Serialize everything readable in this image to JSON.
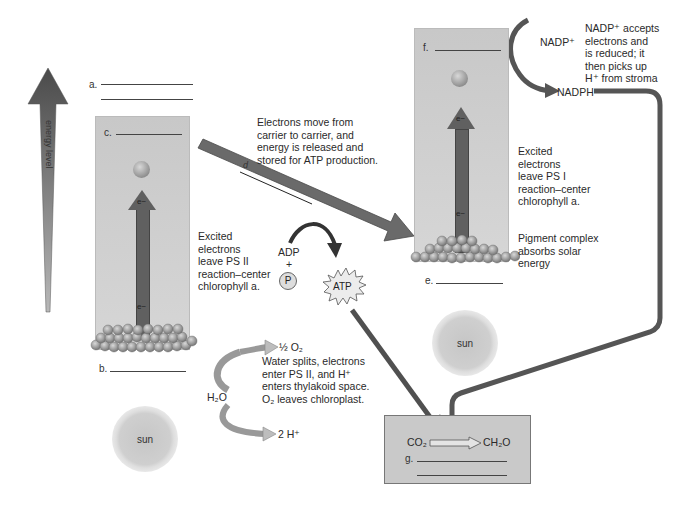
{
  "energy_axis": {
    "label": "energy level"
  },
  "labels": {
    "a": "a.",
    "b": "b.",
    "c": "c.",
    "d": "d",
    "e": "e.",
    "f": "f.",
    "g": "g."
  },
  "ps2": {
    "electron_top": "e−",
    "electron_bottom": "e−",
    "caption": [
      "Excited",
      "electrons",
      "leave PS II",
      "reaction–center",
      "chlorophyll a."
    ]
  },
  "ps1": {
    "electron_top": "e−",
    "electron_bottom": "e−",
    "caption": [
      "Excited",
      "electrons",
      "leave PS I",
      "reaction–center",
      "chlorophyll a."
    ],
    "pigment_caption": [
      "Pigment complex",
      "absorbs solar",
      "energy"
    ]
  },
  "transport": {
    "caption": [
      "Electrons move from",
      "carrier to carrier, and",
      "energy is released and",
      "stored for ATP production."
    ]
  },
  "atp": {
    "adp": "ADP",
    "plus": "+",
    "p": "P",
    "atp": "ATP"
  },
  "water": {
    "h2o": "H₂O",
    "o2": "½ O₂",
    "h": "2 H⁺",
    "caption": [
      "Water splits, electrons",
      "enter PS II, and H⁺",
      "enters thylakoid space.",
      "O₂ leaves chloroplast."
    ]
  },
  "nadp": {
    "nadp_plus": "NADP⁺",
    "nadph": "NADPH",
    "caption": [
      "NADP⁺ accepts",
      "electrons and",
      "is reduced; it",
      "then picks up",
      "H⁺ from stroma"
    ]
  },
  "calvin": {
    "co2": "CO₂",
    "ch2o": "CH₂O"
  },
  "sun_left": {
    "label": "sun"
  },
  "sun_right": {
    "label": "sun"
  },
  "colors": {
    "arrow_dark": "#5a5a5a",
    "panel": "#cccccc",
    "sphere": "#a0a0a0",
    "background": "#ffffff"
  }
}
